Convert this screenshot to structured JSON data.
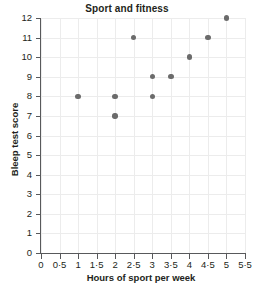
{
  "chart_data": {
    "type": "scatter",
    "title": "Sport and fitness",
    "xlabel": "Hours of sport per week",
    "ylabel": "Bleep test score",
    "xlim": [
      0,
      5.5
    ],
    "ylim": [
      0,
      12
    ],
    "grid": true,
    "legend": null,
    "decimal_separator": "·",
    "xticks": [
      0,
      0.5,
      1,
      1.5,
      2,
      2.5,
      3,
      3.5,
      4,
      4.5,
      5,
      5.5
    ],
    "xticklabels": [
      "0",
      "0·5",
      "1",
      "1·5",
      "2",
      "2·5",
      "3",
      "3·5",
      "4",
      "4·5",
      "5",
      "5·5"
    ],
    "yticks": [
      0,
      1,
      2,
      3,
      4,
      5,
      6,
      7,
      8,
      9,
      10,
      11,
      12
    ],
    "yticklabels": [
      "0",
      "1",
      "2",
      "3",
      "4",
      "5",
      "6",
      "7",
      "8",
      "9",
      "10",
      "11",
      "12"
    ],
    "x": [
      1,
      2,
      2,
      2.5,
      3,
      3,
      3.5,
      4,
      4.5,
      5
    ],
    "y": [
      8,
      8,
      7,
      11,
      9,
      8,
      9,
      10,
      11,
      12
    ],
    "points": [
      {
        "x": 1,
        "y": 8
      },
      {
        "x": 2,
        "y": 8
      },
      {
        "x": 2,
        "y": 7
      },
      {
        "x": 2.5,
        "y": 11
      },
      {
        "x": 3,
        "y": 9
      },
      {
        "x": 3,
        "y": 8
      },
      {
        "x": 3.5,
        "y": 9
      },
      {
        "x": 4,
        "y": 10
      },
      {
        "x": 4.5,
        "y": 11
      },
      {
        "x": 5,
        "y": 12
      }
    ],
    "marker": "circle",
    "marker_color": "#6b6b6b",
    "gridline_color": "#ececec",
    "axis_color": "#58595b",
    "text_color": "#231f20",
    "background": "#ffffff"
  }
}
